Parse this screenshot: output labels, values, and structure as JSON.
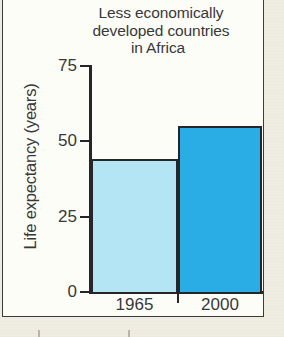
{
  "figure": {
    "panel_background": "#fdfdf7",
    "page_background": "#efece1",
    "border_color": "#3a3a38"
  },
  "chart_data": {
    "type": "bar",
    "title": "Less economically developed countries in Africa",
    "title_lines": [
      "Less economically",
      "developed countries",
      "in Africa"
    ],
    "xlabel": "",
    "ylabel": "Life expectancy (years)",
    "categories": [
      "1965",
      "2000"
    ],
    "values": [
      44,
      55
    ],
    "series": [
      {
        "name": "Life expectancy",
        "values": [
          44,
          55
        ]
      }
    ],
    "bar_colors": [
      "#b3e5f5",
      "#29ade4"
    ],
    "bar_outline": "#26262a",
    "ylim": [
      0,
      75
    ],
    "yticks": [
      0,
      25,
      50,
      75
    ],
    "ytick_labels": [
      "0",
      "25",
      "50",
      "75"
    ],
    "grid": false,
    "legend": "none"
  }
}
